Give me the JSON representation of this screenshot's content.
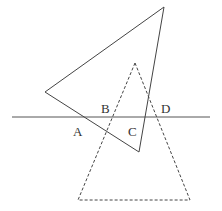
{
  "diagram": {
    "labels": {
      "A": "A",
      "B": "B",
      "C": "C",
      "D": "D"
    },
    "colors": {
      "stroke": "#444444",
      "label": "#333333",
      "background": "#ffffff"
    }
  }
}
